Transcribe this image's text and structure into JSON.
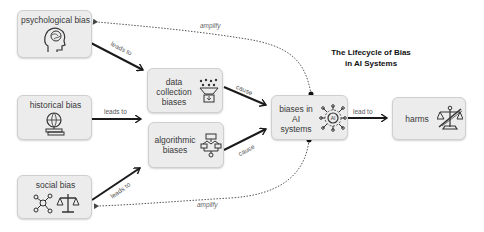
{
  "title": {
    "line1": "The Lifecycle of Bias",
    "line2": "in AI Systems"
  },
  "nodes": {
    "psychological": {
      "label": "psychological bias",
      "icon": "brain-head-icon"
    },
    "historical": {
      "label": "historical bias",
      "icon": "globe-books-icon"
    },
    "social": {
      "label": "social bias",
      "icon": "network-scales-icon"
    },
    "data_collection": {
      "line1": "data",
      "line2": "collection",
      "line3": "biases",
      "icon": "data-funnel-icon"
    },
    "algorithmic": {
      "line1": "algorithmic",
      "line2": "biases",
      "icon": "flowchart-icon"
    },
    "ai_systems": {
      "line1": "biases in",
      "line2": "AI",
      "line3": "systems",
      "icon": "ai-chip-icon"
    },
    "harms": {
      "label": "harms",
      "icon": "broken-scales-icon"
    }
  },
  "edges": {
    "psych_to_data": "leads to",
    "hist_to_data": "leads to",
    "social_to_algo": "leads to",
    "data_to_ai": "cause",
    "algo_to_ai": "cause",
    "ai_to_harms": "lead to",
    "ai_to_psych": "amplify",
    "ai_to_social": "amplify"
  },
  "colors": {
    "node_fill": "#ececec",
    "node_border": "#cfcfcf",
    "arrow": "#1a1a1a",
    "dotted": "#555555"
  }
}
